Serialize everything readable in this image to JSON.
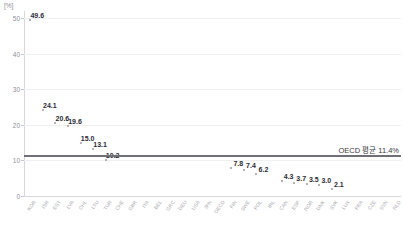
{
  "chart_data": {
    "type": "scatter",
    "title": "",
    "xlabel": "",
    "ylabel": "",
    "unit_label": "[%]",
    "ylim": [
      0,
      52
    ],
    "yticks": [
      0,
      10,
      20,
      30,
      40,
      50
    ],
    "grid": true,
    "legend": null,
    "categories": [
      "KOR",
      "ISR",
      "EST",
      "LVA",
      "CHL",
      "LTU",
      "TUR",
      "CHE",
      "GBR",
      "ITA",
      "BEL",
      "GRC",
      "DEU",
      "USA",
      "JPN",
      "OECD",
      "FIN",
      "SWE",
      "POL",
      "IRL",
      "CAN",
      "ESP",
      "NOR",
      "DNK",
      "SVK",
      "LUX",
      "FRA",
      "CZE",
      "SVN",
      "NLD"
    ],
    "values": [
      49.6,
      24.1,
      20.6,
      19.6,
      15.0,
      13.1,
      10.2,
      null,
      null,
      null,
      null,
      null,
      null,
      null,
      null,
      null,
      7.8,
      7.4,
      6.2,
      null,
      4.3,
      3.7,
      3.5,
      3.0,
      2.1,
      null,
      null,
      null,
      null,
      null
    ],
    "labeled_points": [
      {
        "category": "KOR",
        "value": 49.6,
        "label": "49.6"
      },
      {
        "category": "ISR",
        "value": 24.1,
        "label": "24.1"
      },
      {
        "category": "EST",
        "value": 20.6,
        "label": "20.6"
      },
      {
        "category": "LVA",
        "value": 19.6,
        "label": "19.6"
      },
      {
        "category": "CHL",
        "value": 15.0,
        "label": "15.0"
      },
      {
        "category": "LTU",
        "value": 13.1,
        "label": "13.1"
      },
      {
        "category": "TUR",
        "value": 10.2,
        "label": "10.2"
      },
      {
        "category": "FIN",
        "value": 7.8,
        "label": "7.8"
      },
      {
        "category": "SWE",
        "value": 7.4,
        "label": "7.4"
      },
      {
        "category": "POL",
        "value": 6.2,
        "label": "6.2"
      },
      {
        "category": "CAN",
        "value": 4.3,
        "label": "4.3"
      },
      {
        "category": "ESP",
        "value": 3.7,
        "label": "3.7"
      },
      {
        "category": "NOR",
        "value": 3.5,
        "label": "3.5"
      },
      {
        "category": "DNK",
        "value": 3.0,
        "label": "3.0"
      },
      {
        "category": "SVK",
        "value": 2.1,
        "label": "2.1"
      }
    ],
    "reference_line": {
      "value": 11.4,
      "annotation": "OECD 평균 11.4%",
      "color": "#6f6f77"
    },
    "colors": {
      "marker": "#9a9aa2",
      "value_label": "#2b2b33",
      "gridline": "#f0f0f2",
      "axis": "#d8d8dc",
      "tick_label": "#8e8e96",
      "category_label": "#a9a9b1",
      "reference_line": "#6f6f77"
    }
  }
}
